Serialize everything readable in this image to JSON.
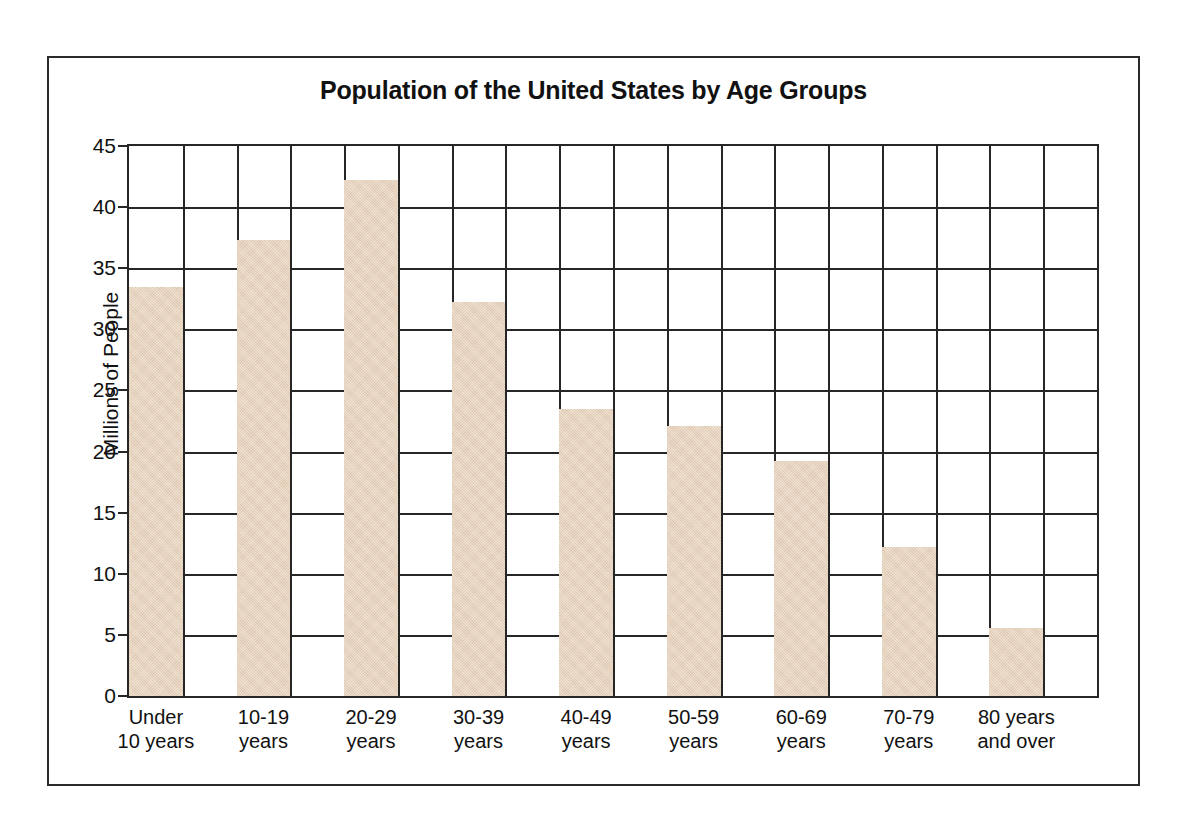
{
  "chart_data": {
    "type": "bar",
    "title": "Population of the United States by Age Groups",
    "xlabel": "",
    "ylabel": "Millions of People",
    "categories": [
      "Under 10 years",
      "10-19 years",
      "20-29 years",
      "30-39 years",
      "40-49 years",
      "50-59 years",
      "60-69 years",
      "70-79 years",
      "80 years and over"
    ],
    "category_lines": [
      [
        "Under",
        "10 years"
      ],
      [
        "10-19",
        "years"
      ],
      [
        "20-29",
        "years"
      ],
      [
        "30-39",
        "years"
      ],
      [
        "40-49",
        "years"
      ],
      [
        "50-59",
        "years"
      ],
      [
        "60-69",
        "years"
      ],
      [
        "70-79",
        "years"
      ],
      [
        "80 years",
        "and over"
      ]
    ],
    "values": [
      33.5,
      37.3,
      42.2,
      32.2,
      23.5,
      22.1,
      19.2,
      12.2,
      5.6
    ],
    "ylim": [
      0,
      45
    ],
    "ytick_step": 5,
    "yticks": [
      0,
      5,
      10,
      15,
      20,
      25,
      30,
      35,
      40,
      45
    ],
    "ytick_labels": [
      "0",
      "5",
      "10",
      "15",
      "20",
      "25",
      "30",
      "35",
      "40",
      "45"
    ],
    "grid": "both",
    "grid_vertical_columns": 18,
    "legend": "none",
    "bar_color": "#e8d4be",
    "grid_color": "#262626",
    "background_color": "#ffffff",
    "frame_color": "#2a2a2a"
  }
}
